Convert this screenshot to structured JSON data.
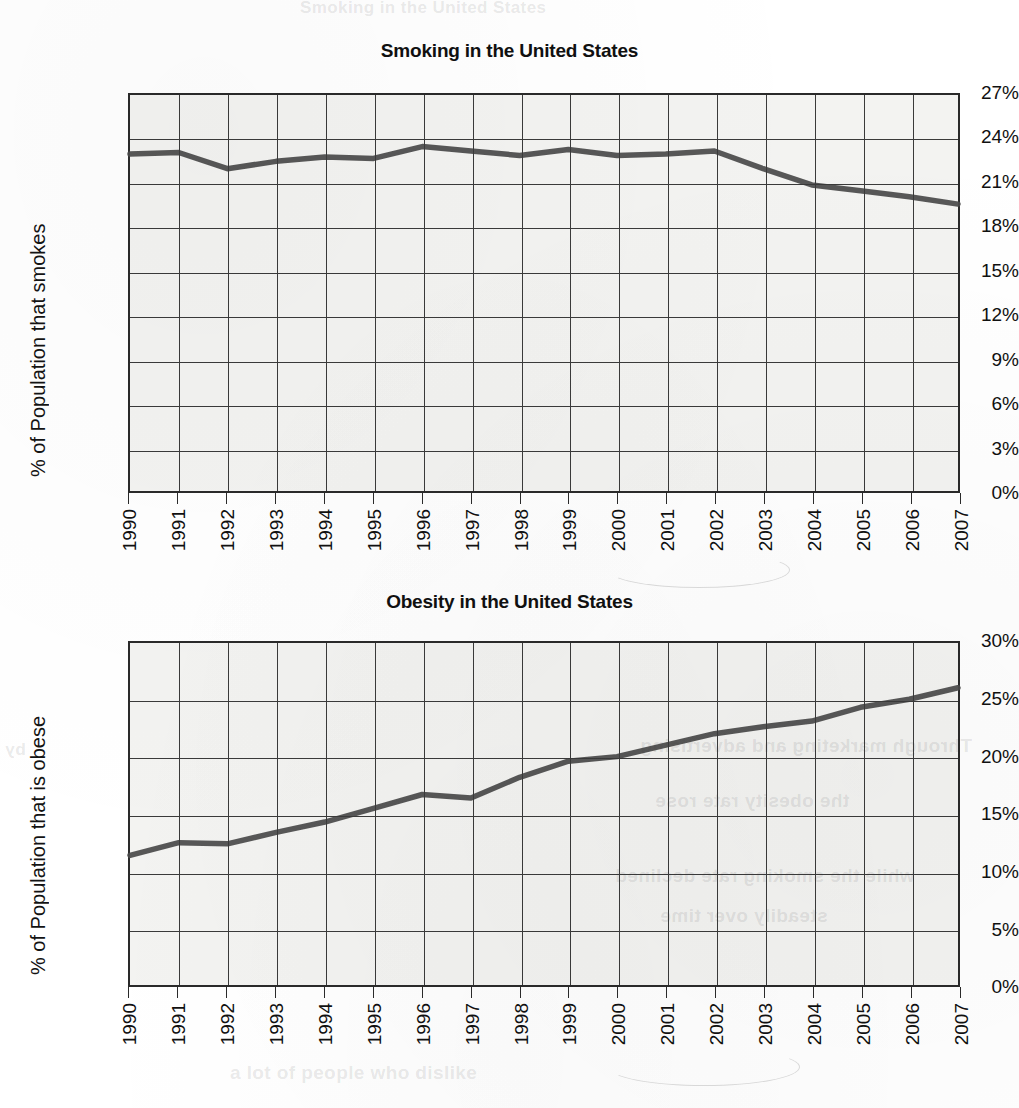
{
  "page": {
    "background_color": "#ffffff",
    "paper_color": "#f3f3f1",
    "grid_color": "#3a3a3a",
    "line_color": "#4a4a4a",
    "ghost_text_top": "cigarette smoking has dropped"
  },
  "charts": [
    {
      "id": "smoking",
      "title": "Smoking in the United States",
      "ylabel": "% of Population that smokes",
      "yticks": [
        "0%",
        "3%",
        "6%",
        "9%",
        "12%",
        "15%",
        "18%",
        "21%",
        "24%",
        "27%"
      ],
      "xticks": [
        "1990",
        "1991",
        "1992",
        "1993",
        "1994",
        "1995",
        "1996",
        "1997",
        "1998",
        "1999",
        "2000",
        "2001",
        "2002",
        "2003",
        "2004",
        "2005",
        "2006",
        "2007"
      ]
    },
    {
      "id": "obesity",
      "title": "Obesity in the United States",
      "ylabel": "% of Population that is obese",
      "yticks": [
        "0%",
        "5%",
        "10%",
        "15%",
        "20%",
        "25%",
        "30%"
      ],
      "xticks": [
        "1990",
        "1991",
        "1992",
        "1993",
        "1994",
        "1995",
        "1996",
        "1997",
        "1998",
        "1999",
        "2000",
        "2001",
        "2002",
        "2003",
        "2004",
        "2005",
        "2006",
        "2007"
      ]
    }
  ],
  "chart_data": [
    {
      "type": "line",
      "title": "Smoking in the United States",
      "xlabel": "",
      "ylabel": "% of Population that smokes",
      "categories": [
        "1990",
        "1991",
        "1992",
        "1993",
        "1994",
        "1995",
        "1996",
        "1997",
        "1998",
        "1999",
        "2000",
        "2001",
        "2002",
        "2003",
        "2004",
        "2005",
        "2006",
        "2007"
      ],
      "values": [
        23.0,
        23.1,
        22.0,
        22.5,
        22.8,
        22.7,
        23.5,
        23.2,
        22.9,
        23.3,
        22.9,
        23.0,
        23.2,
        22.0,
        20.9,
        20.5,
        20.1,
        19.6
      ],
      "tick_labels_y": [
        "0%",
        "3%",
        "6%",
        "9%",
        "12%",
        "15%",
        "18%",
        "21%",
        "24%",
        "27%"
      ],
      "ylim": [
        0,
        27
      ],
      "ytick_step": 3,
      "grid": true,
      "legend": "none",
      "units": "percent"
    },
    {
      "type": "line",
      "title": "Obesity in the United States",
      "xlabel": "",
      "ylabel": "% of Population that is obese",
      "categories": [
        "1990",
        "1991",
        "1992",
        "1993",
        "1994",
        "1995",
        "1996",
        "1997",
        "1998",
        "1999",
        "2000",
        "2001",
        "2002",
        "2003",
        "2004",
        "2005",
        "2006",
        "2007"
      ],
      "values": [
        11.5,
        12.6,
        12.5,
        13.5,
        14.4,
        15.6,
        16.8,
        16.5,
        18.3,
        19.7,
        20.1,
        21.1,
        22.1,
        22.7,
        23.2,
        24.4,
        25.1,
        26.1
      ],
      "tick_labels_y": [
        "0%",
        "5%",
        "10%",
        "15%",
        "20%",
        "25%",
        "30%"
      ],
      "ylim": [
        0,
        30
      ],
      "ytick_step": 5,
      "grid": true,
      "legend": "none",
      "units": "percent"
    }
  ]
}
